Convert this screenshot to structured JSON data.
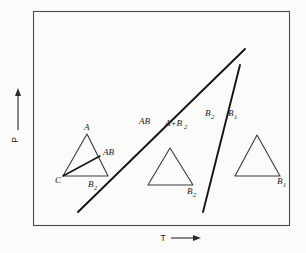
{
  "figure": {
    "type": "phase-diagram",
    "axes": {
      "x": {
        "label": "T",
        "arrow": "right-arrow-icon"
      },
      "y": {
        "label": "P",
        "arrow": "up-arrow-icon"
      }
    },
    "field_labels": [
      {
        "id": "ab",
        "text": "AB",
        "x": 139,
        "y": 124
      },
      {
        "id": "a-plus-b2",
        "text": "A+B",
        "sub": "2",
        "x": 165,
        "y": 126
      },
      {
        "id": "b2",
        "text": "B",
        "sub": "2",
        "x": 205,
        "y": 116
      },
      {
        "id": "b1",
        "text": "B",
        "sub": "1",
        "x": 228,
        "y": 116
      }
    ],
    "triangles": [
      {
        "id": "left-triangle",
        "vertices": {
          "apex": "A",
          "bottom_left": "C",
          "bottom_right": "B",
          "bottom_right_sub": "2"
        },
        "interior_point": {
          "label": "AB",
          "sub": ""
        }
      },
      {
        "id": "middle-triangle",
        "vertices": {
          "bottom_right": "B",
          "bottom_right_sub": "2"
        }
      },
      {
        "id": "right-triangle",
        "vertices": {
          "bottom_right": "B",
          "bottom_right_sub": "1"
        }
      }
    ],
    "vertex_labels": {
      "left_apex": "A",
      "left_bottom_left": "C",
      "left_bottom_right": "B",
      "left_bottom_right_sub": "2",
      "left_interior": "AB",
      "middle_bottom_right": "B",
      "middle_bottom_right_sub": "2",
      "right_bottom_right": "B",
      "right_bottom_right_sub": "1"
    },
    "colors": {
      "background": "#fbfbf9",
      "frame": "#4a4a4a",
      "phase_line": "#141414",
      "triangle": "#3a3a3a",
      "text": "#1a1a1a"
    }
  }
}
